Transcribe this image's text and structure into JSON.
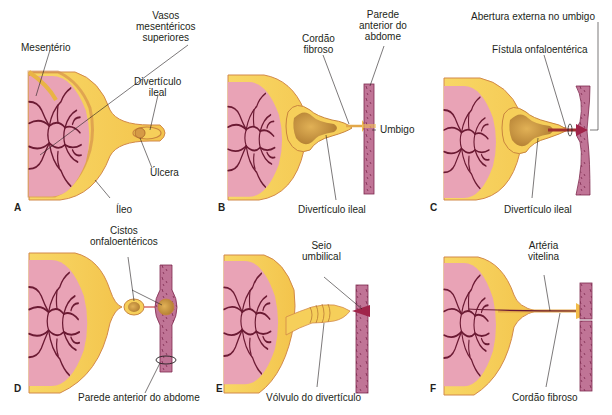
{
  "figure": {
    "colors": {
      "mesentery_pink": "#e9a3b6",
      "vessel_maroon": "#6b1a33",
      "ileum_yellow": "#f6cf5a",
      "ileum_inner": "#e9b445",
      "ileum_edge": "#d2894a",
      "lumen_brown": "#c89442",
      "wall_pink": "#b9698e",
      "wall_dark": "#7d2a4e",
      "line_black": "#231f20"
    },
    "panels": [
      {
        "letter": "A",
        "labels": {
          "mesentery": "Mesentério",
          "vessels": "Vasos\nmesentéricos\nsuperiores",
          "diverticulum": "Divertículo\nileal",
          "ulcer": "Úlcera",
          "ileum": "Íleo"
        }
      },
      {
        "letter": "B",
        "labels": {
          "cord": "Cordão\nfibroso",
          "wall": "Parede\nanterior do\nabdome",
          "umbilicus": "Umbigo",
          "diverticulum": "Divertículo ileal"
        }
      },
      {
        "letter": "C",
        "labels": {
          "opening": "Abertura externa no umbigo",
          "fistula": "Fístula onfaloentérica",
          "diverticulum": "Divertículo ileal"
        }
      },
      {
        "letter": "D",
        "labels": {
          "cysts": "Cistos\nonfaloentéricos",
          "wall": "Parede anterior do abdome"
        }
      },
      {
        "letter": "E",
        "labels": {
          "sinus": "Seio\numbilical",
          "volvulus": "Vólvulo do divertículo"
        }
      },
      {
        "letter": "F",
        "labels": {
          "artery": "Artéria\nvitelina",
          "cord": "Cordão fibroso"
        }
      }
    ]
  }
}
